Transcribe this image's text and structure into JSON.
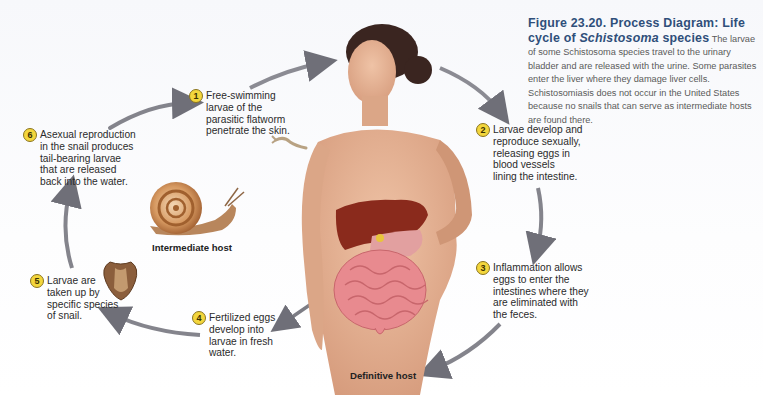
{
  "figure": {
    "number_title": "Figure 23.20. Process Diagram: Life cycle of",
    "species_italic": "Schistosoma",
    "species_suffix": " species",
    "body": "The larvae of some Schistosoma species travel to the urinary bladder and are released with the urine. Some parasites enter the liver where they damage liver cells. Schistosomiasis does not occur in the United States because no snails that can serve as intermediate hosts are found there."
  },
  "steps": [
    {
      "number": "1",
      "lines": [
        "Free-swimming",
        "larvae of the",
        "parasitic flatworm",
        "penetrate the skin."
      ]
    },
    {
      "number": "2",
      "lines": [
        "Larvae develop and",
        "reproduce sexually,",
        "releasing eggs in",
        "blood vessels",
        "lining the intestine."
      ]
    },
    {
      "number": "3",
      "lines": [
        "Inflammation allows",
        "eggs to enter the",
        "intestines where they",
        "are eliminated with",
        "the feces."
      ]
    },
    {
      "number": "4",
      "lines": [
        "Fertilized eggs",
        "develop into",
        "larvae in fresh",
        "water."
      ]
    },
    {
      "number": "5",
      "lines": [
        "Larvae are",
        "taken up by",
        "specific species",
        "of snail."
      ]
    },
    {
      "number": "6",
      "lines": [
        "Asexual reproduction",
        "in the snail produces",
        "tail-bearing larvae",
        "that are released",
        "back into the water."
      ]
    }
  ],
  "hosts": {
    "intermediate": "Intermediate host",
    "definitive": "Definitive host"
  },
  "colors": {
    "title_blue": "#2f4f7a",
    "badge_yellow": "#f3d63c",
    "arrow_gray": "#6f6f78",
    "skin": "#e7b497",
    "liver": "#8a2a1c",
    "intestine": "#e88a8f"
  }
}
